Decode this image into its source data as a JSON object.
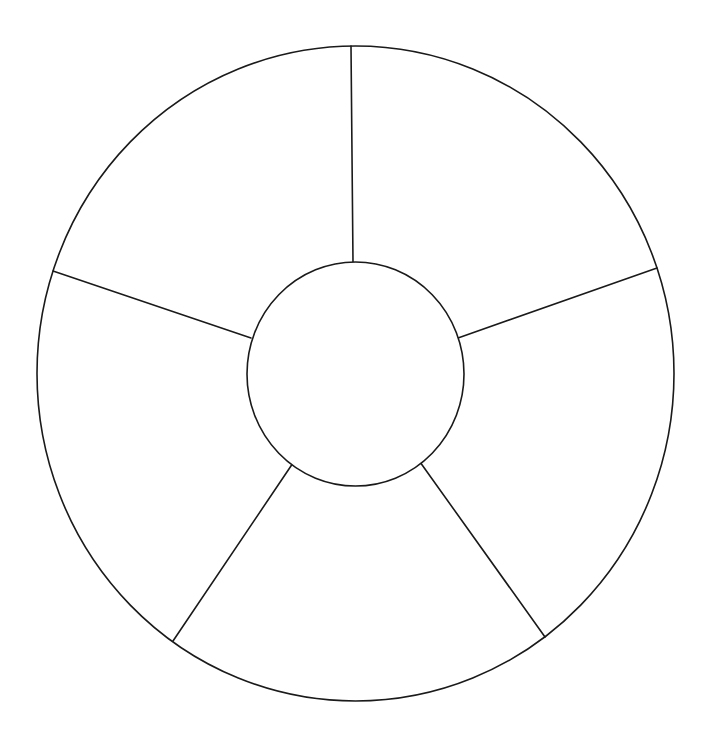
{
  "diagram": {
    "type": "segmented-wheel",
    "segment_count": 5,
    "stroke_color": "#1a1a1a",
    "background_color": "#ffffff",
    "outer_ring": {
      "cx": 355.5,
      "cy": 373.5,
      "rx": 318.5,
      "ry": 327.5
    },
    "inner_hub": {
      "cx": 355.5,
      "cy": 374,
      "rx": 108.5,
      "ry": 112
    },
    "spokes": [
      {
        "name": "spoke-top",
        "x1": 351,
        "y1": 46,
        "x2": 353,
        "y2": 262
      },
      {
        "name": "spoke-upper-right",
        "x1": 657,
        "y1": 268,
        "x2": 458,
        "y2": 338
      },
      {
        "name": "spoke-lower-right",
        "x1": 545,
        "y1": 637,
        "x2": 420,
        "y2": 462
      },
      {
        "name": "spoke-lower-left",
        "x1": 173,
        "y1": 641,
        "x2": 293,
        "y2": 463
      },
      {
        "name": "spoke-upper-left",
        "x1": 53,
        "y1": 271,
        "x2": 251,
        "y2": 338
      }
    ],
    "segments": [
      {
        "name": "segment-top-right",
        "label": ""
      },
      {
        "name": "segment-right",
        "label": ""
      },
      {
        "name": "segment-bottom",
        "label": ""
      },
      {
        "name": "segment-left",
        "label": ""
      },
      {
        "name": "segment-top-left",
        "label": ""
      }
    ],
    "hub_label": ""
  }
}
